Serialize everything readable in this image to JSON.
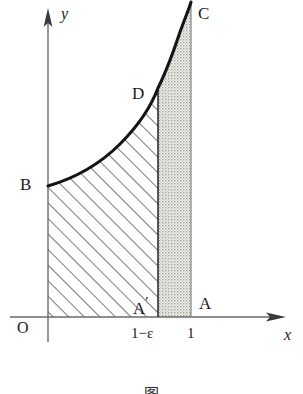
{
  "figure": {
    "title_caption": "图",
    "background_color": "#ffffff",
    "ink_color": "#1a1a1a",
    "curve_color": "#141414",
    "hatch_color": "#4a4a4a",
    "stipple_color": "#b9b9b3"
  },
  "axes": {
    "x_axis_name": "x",
    "y_axis_name": "y",
    "origin_label": "O",
    "x_ticks": [
      {
        "label": "1−ε",
        "x_value": 0.8
      },
      {
        "label": "1",
        "x_value": 1.0
      }
    ]
  },
  "points": [
    {
      "name": "B",
      "label": "B",
      "x": 0.0,
      "y": 0.72,
      "note": "curve start on y-axis"
    },
    {
      "name": "D",
      "label": "D",
      "x": 0.8,
      "y": 2.05,
      "note": "curve at x = 1-epsilon"
    },
    {
      "name": "C",
      "label": "C",
      "x": 1.0,
      "y": 3.6,
      "note": "curve top at x = 1"
    },
    {
      "name": "A-prime",
      "label": "A",
      "prime": "′",
      "x": 0.8,
      "y": 0.0,
      "note": "foot of x = 1-epsilon"
    },
    {
      "name": "A",
      "label": "A",
      "x": 1.0,
      "y": 0.0,
      "note": "foot of x = 1"
    }
  ],
  "regions": [
    {
      "name": "hatched-region",
      "fill_style": "diagonal-hatch",
      "description": "O B D A′ : area under the curve from x = 0 to x = 1−ε",
      "x_from": 0.0,
      "x_to": 0.8
    },
    {
      "name": "stippled-region",
      "fill_style": "stipple",
      "description": "A′ D C A : area under the curve from x = 1−ε to x = 1",
      "x_from": 0.8,
      "x_to": 1.0
    }
  ],
  "curve": {
    "name": "improper-integrand",
    "description": "increasing curve rising steeply to a vertical asymptote at x = 1",
    "start": {
      "x": 0.0,
      "y": 0.72
    },
    "end": {
      "x": 1.0,
      "y": 3.6
    }
  }
}
